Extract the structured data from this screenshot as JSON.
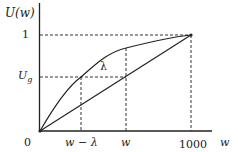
{
  "diagram": {
    "y_axis_label": "U(w)",
    "x_axis_label": "w",
    "y_ticks": {
      "one": "1",
      "ug_main": "U",
      "ug_sub": "g"
    },
    "x_ticks": {
      "origin": "0",
      "w_minus_lambda": "w − λ",
      "w": "w",
      "thousand": "1000"
    },
    "curve_label": "λ",
    "colors": {
      "line": "#222222",
      "background": "#ffffff"
    }
  }
}
